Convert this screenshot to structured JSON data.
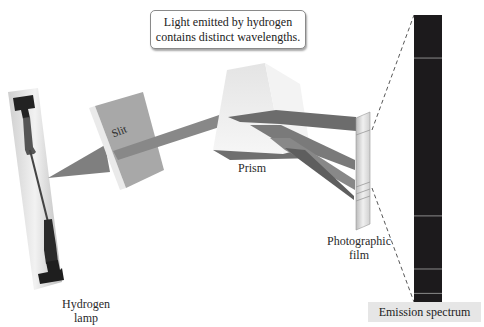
{
  "callout": {
    "line1": "Light emitted by hydrogen",
    "line2": "contains distinct wavelengths."
  },
  "labels": {
    "lamp_line1": "Hydrogen",
    "lamp_line2": "lamp",
    "slit": "Slit",
    "prism": "Prism",
    "film_line1": "Photographic",
    "film_line2": "film",
    "spectrum": "Emission spectrum"
  },
  "spectrum": {
    "background_color": "#1c1a1c",
    "line_color": "#8a8a8a",
    "lines_fraction_from_top": [
      0.15,
      0.7,
      0.885,
      0.97
    ]
  },
  "colors": {
    "beam": "#7f7f7f",
    "beam_dark": "#5c5c5c",
    "prism_light": "#ececec",
    "slit_face": "#a9a9a9"
  }
}
